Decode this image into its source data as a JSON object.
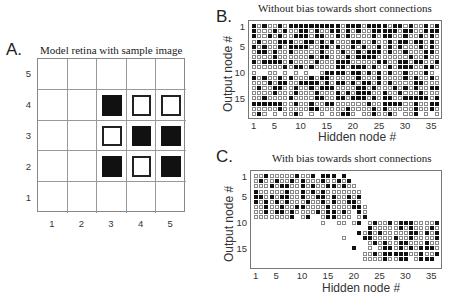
{
  "panels": {
    "A": {
      "letter": "A.",
      "title": "Model retina with sample image",
      "x_ticks": [
        "1",
        "2",
        "3",
        "4",
        "5"
      ],
      "y_ticks": [
        "5",
        "4",
        "3",
        "2",
        "1"
      ]
    },
    "B": {
      "letter": "B.",
      "title": "Without bias towards short connections",
      "xlabel": "Hidden node #",
      "ylabel": "Output node #",
      "x_ticks": [
        "1",
        "5",
        "10",
        "15",
        "20",
        "25",
        "30",
        "35"
      ],
      "y_ticks": [
        "1",
        "5",
        "10",
        "15"
      ]
    },
    "C": {
      "letter": "C.",
      "title": "With bias towards short connections",
      "xlabel": "Hidden node #",
      "ylabel": "Output node #",
      "x_ticks": [
        "1",
        "5",
        "10",
        "15",
        "20",
        "25",
        "30",
        "35"
      ],
      "y_ticks": [
        "1",
        "5",
        "10",
        "15"
      ]
    }
  },
  "chart_data": [
    {
      "type": "heatmap",
      "title": "Model retina with sample image",
      "xlabel": "",
      "ylabel": "",
      "x": [
        1,
        2,
        3,
        4,
        5
      ],
      "y": [
        1,
        2,
        3,
        4,
        5
      ],
      "legend": {
        "filled": "on pixel (black)",
        "open": "off pixel (white, outlined)"
      },
      "cells": [
        {
          "x": 3,
          "y": 4,
          "value": "on"
        },
        {
          "x": 4,
          "y": 4,
          "value": "off"
        },
        {
          "x": 5,
          "y": 4,
          "value": "off"
        },
        {
          "x": 3,
          "y": 3,
          "value": "off"
        },
        {
          "x": 4,
          "y": 3,
          "value": "on"
        },
        {
          "x": 5,
          "y": 3,
          "value": "on"
        },
        {
          "x": 3,
          "y": 2,
          "value": "on"
        },
        {
          "x": 4,
          "y": 2,
          "value": "off"
        },
        {
          "x": 5,
          "y": 2,
          "value": "on"
        }
      ],
      "grid": true
    },
    {
      "type": "heatmap",
      "title": "Without bias towards short connections",
      "xlabel": "Hidden node #",
      "ylabel": "Output node #",
      "xlim": [
        1,
        36
      ],
      "ylim": [
        1,
        18
      ],
      "encoding": "each row = output node 1..18, each char = hidden node 1..36; '#' filled square, 'o' open square, '.' no connection",
      "rows": [
        "#o#oo#o##########o###o####o##o#oo#o#",
        "#ooo#o#oo##o#oo##o#o#oo#####o##oo###",
        "#oo#o#oo###o##oo#o#oooo#o##oo#oo#o#o",
        "o#ooo###oo##o#o#ooo##oo#oo#o##o##o#o",
        "#o#oo#o####oo##o#oo#o#oo#o#o#ooo#o#o",
        "o##o#oo#ooooo#ooo#oo#o###o#oo#ooo##o",
        "oooo#oooooo#o##ooo#o####oooooo#oo#oo",
        "#o####o#oooo#ooo###ooooo##oo##o##oo#",
        "oooooo#o##o#oooo##o###o#oo#o###oo##o",
        "o..oo.o.o.o..o####o##o#o#o#oo#ooo#o.",
        "#o#oo#o#ooo#o##ooooo#ooo#oooo#o#oo#o",
        "ooo#o##oo####o#o##o#o##o#o#oooo##ooo",
        "o#oo##oo#oo#o###oooo##o#ooo#o#o#oo##",
        "oooo#ooo#ooo#ooo#o#o###oo#oo#ooo#ooo",
        "oo#oooo#oooo##oo##o###o#o##oo#####o#",
        "######oo#oo#oo##oooooo#oo####oo#oo##",
        "ooooo#ooooo##ooooo#oooo#o#ooooo#oo#o",
        "o#o.o.oo#o.o.o.oo##o.oo#oo#o.oo#.o.o"
      ]
    },
    {
      "type": "heatmap",
      "title": "With bias towards short connections",
      "xlabel": "Hidden node #",
      "ylabel": "Output node #",
      "xlim": [
        1,
        36
      ],
      "ylim": [
        1,
        18
      ],
      "encoding": "each row = output node 1..18, each char = hidden node 1..36; '#' filled square, 'o' open square, '.' no connection",
      "rows": [
        "oo#ooooo#oo#.###.#..................",
        "o#oo#oo#o#ooo#oo#o#.................",
        "ooo#o##oo#o#oo##o#oo................",
        "#ooooo#oo#o#o#ooooooo...............",
        "##o#o##oo#oo##o#oo#o#...............",
        "#o#o#o#ooo#oo#o#oo##o...............",
        "oo#oo#oo##oooo#oooo##o..............",
        "oo#o##o#oooo#o##o#o.#o..............",
        "ooooooo#.o#..o##ooo.o#..............",
        ".............o..oo.o#.o#oo#o###oooo#",
        "......................#ooooo#o#ooo#o",
        "....................#o#o#ooooo##o#o#",
        ".................o...##oooo#oo#oooo#",
        "......................o#o#oo##ooo#oo",
        "...................#..o.o##o#o#o###o",
        ".....................oo#o#####oo#oo#",
        ".....................oooo#oo##.o###.",
        "...................................."
      ]
    }
  ]
}
